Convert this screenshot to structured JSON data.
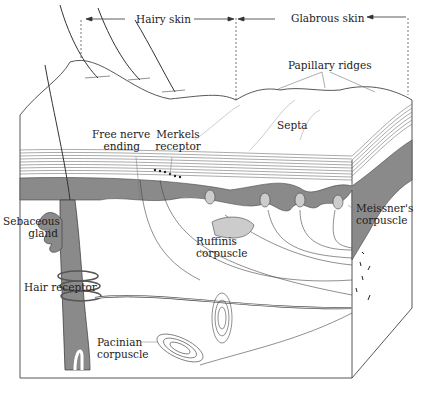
{
  "diagram": {
    "regions": {
      "hairy_skin": "Hairy skin",
      "glabrous_skin": "Glabrous skin"
    },
    "labels": {
      "papillary_ridges": "Papillary ridges",
      "septa": "Septa",
      "free_nerve_ending_1": "Free nerve",
      "free_nerve_ending_2": "ending",
      "merkels_1": "Merkels",
      "merkels_2": "receptor",
      "sebaceous_1": "Sebaceous",
      "sebaceous_2": "gland",
      "ruffinis_1": "Ruffinis",
      "ruffinis_2": "corpuscle",
      "meissners_1": "Meissner's",
      "meissners_2": "corpuscle",
      "hair_receptor": "Hair receptor",
      "pacinian_1": "Pacinian",
      "pacinian_2": "corpuscle"
    },
    "colors": {
      "dermis_fill": "#8a8a8a",
      "line": "#333333",
      "background": "#ffffff"
    }
  }
}
